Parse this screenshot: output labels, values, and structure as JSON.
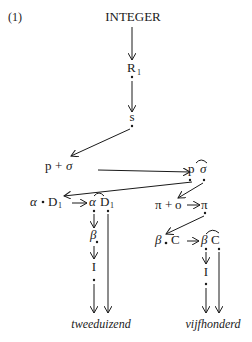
{
  "figure": {
    "number": "(1)",
    "root": "INTEGER",
    "nodes": {
      "r1": {
        "main": "R",
        "sub": "1"
      },
      "s": "s",
      "p_plus_sigma": {
        "p": "p",
        "plus": "+",
        "sigma": "σ"
      },
      "p_sigma_arc": {
        "p": "p",
        "sigma": "σ"
      },
      "alpha_dot_d1": {
        "alpha": "α",
        "d": "D",
        "sub": "1"
      },
      "alpha_d1_arc": {
        "alpha": "α",
        "d": "D",
        "sub": "1"
      },
      "pi_plus_o": {
        "pi": "π",
        "plus": "+",
        "o": "o"
      },
      "pi": "π",
      "beta_dot_c": {
        "beta": "β",
        "c": "C"
      },
      "beta_c_arc": {
        "beta": "β",
        "c": "C"
      },
      "beta_left": "β",
      "i_left": "I",
      "i_right": "I"
    },
    "outputs": {
      "left": "tweeduizend",
      "right": "vijfhonderd"
    }
  }
}
